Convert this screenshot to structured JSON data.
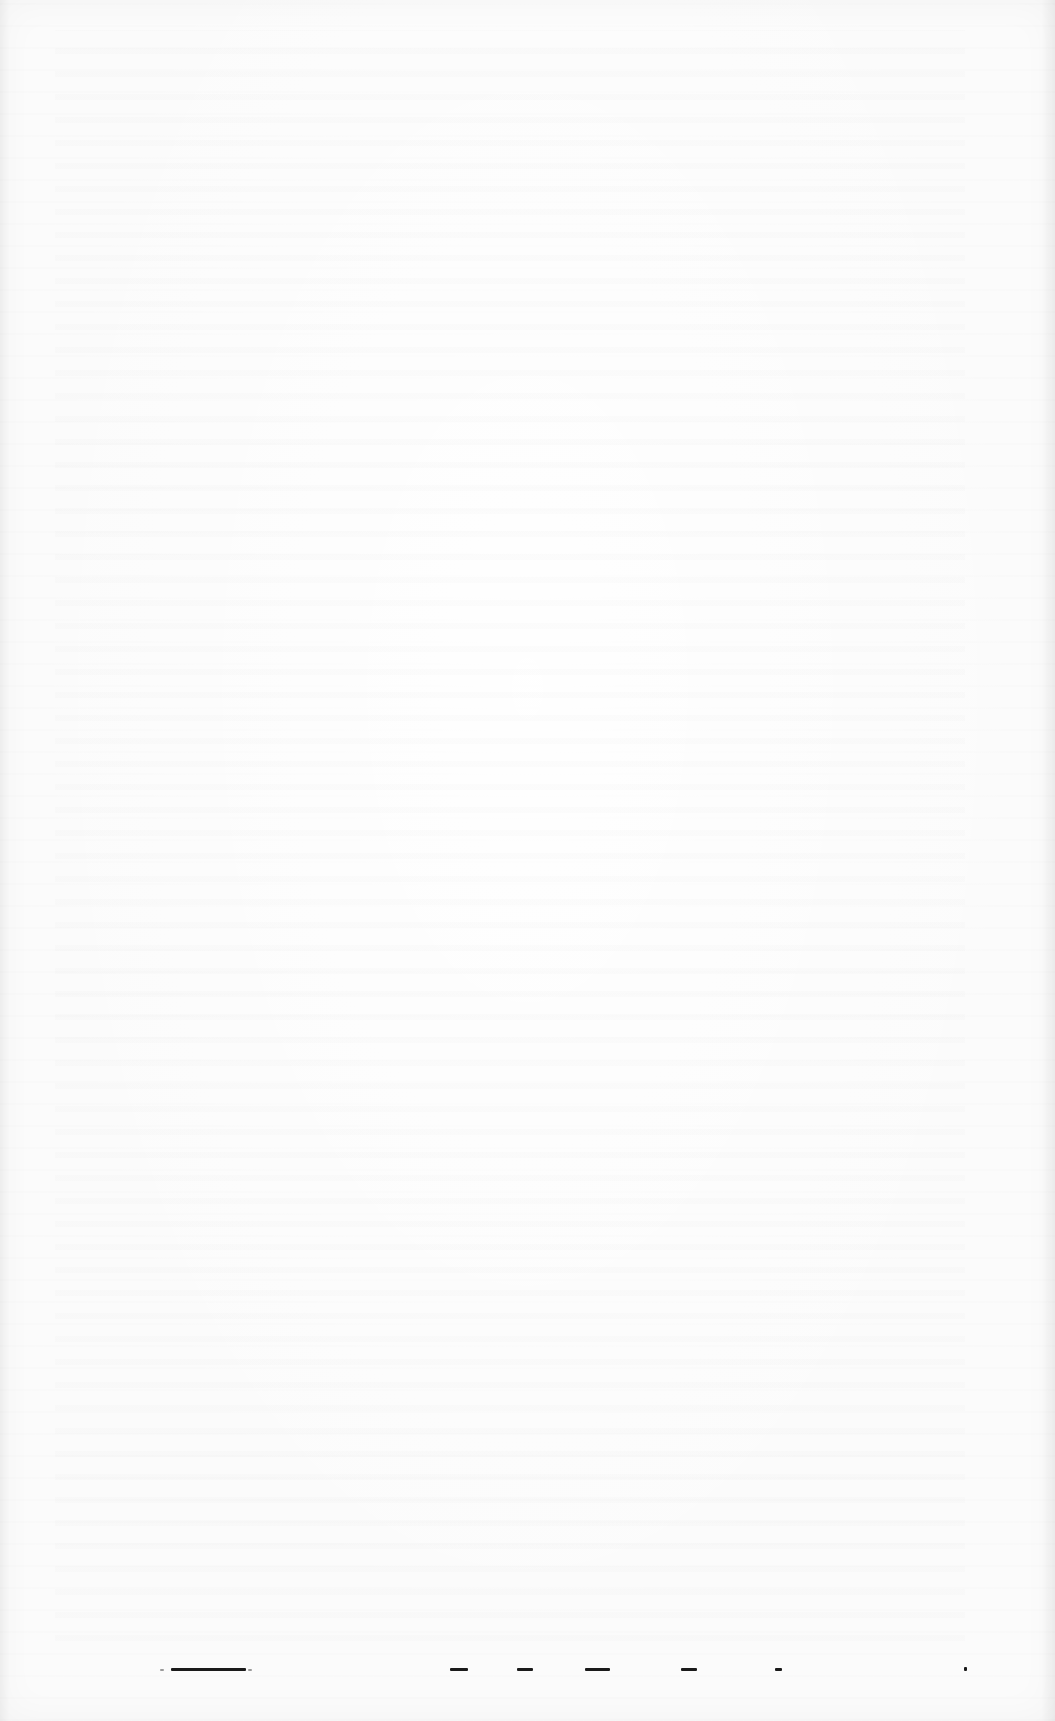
{
  "document": {
    "type": "scanned-page",
    "background_color": "#fbfbfb",
    "ink_color": "#1a1a1a",
    "legible_text": "",
    "bottom_line_fragments": [
      {
        "left": 160,
        "width": 4,
        "style": "faint"
      },
      {
        "left": 171,
        "width": 75,
        "style": "solid"
      },
      {
        "left": 248,
        "width": 4,
        "style": "faint"
      },
      {
        "left": 450,
        "width": 18,
        "style": "solid"
      },
      {
        "left": 517,
        "width": 16,
        "style": "solid"
      },
      {
        "left": 585,
        "width": 25,
        "style": "solid"
      },
      {
        "left": 681,
        "width": 16,
        "style": "solid"
      },
      {
        "left": 775,
        "width": 7,
        "style": "solid"
      },
      {
        "left": 964,
        "width": 3,
        "style": "dot"
      }
    ]
  }
}
